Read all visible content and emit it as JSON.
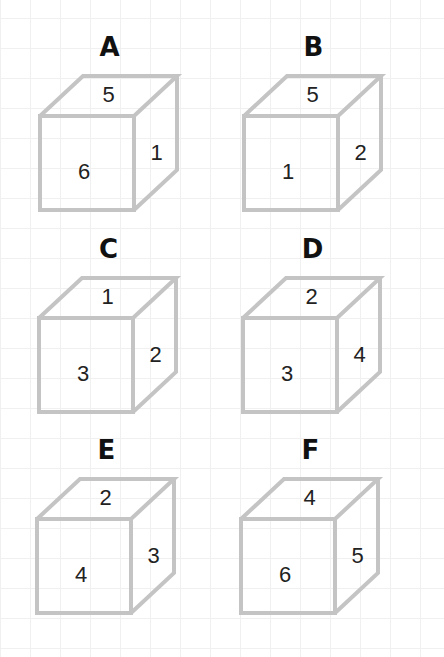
{
  "cubes": [
    {
      "label": "A",
      "top": 5,
      "front": 6,
      "right": 1,
      "x": 40,
      "y": 116
    },
    {
      "label": "B",
      "top": 5,
      "front": 1,
      "right": 2,
      "x": 244,
      "y": 116
    },
    {
      "label": "C",
      "top": 1,
      "front": 3,
      "right": 2,
      "x": 39,
      "y": 318
    },
    {
      "label": "D",
      "top": 2,
      "front": 3,
      "right": 4,
      "x": 243,
      "y": 318
    },
    {
      "label": "E",
      "top": 2,
      "front": 4,
      "right": 3,
      "x": 37,
      "y": 519
    },
    {
      "label": "F",
      "top": 4,
      "front": 6,
      "right": 5,
      "x": 241,
      "y": 519
    }
  ],
  "style": {
    "edge_color": "#c4c4c4",
    "grid_color": "#f0f0f0"
  }
}
